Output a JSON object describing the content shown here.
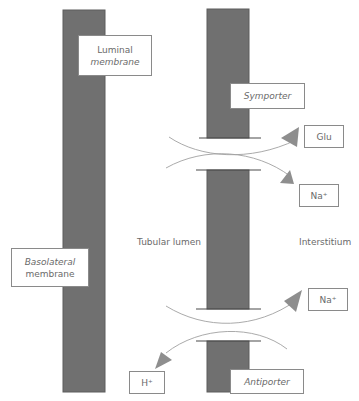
{
  "colors": {
    "membrane": "#6f6f6f",
    "membrane_edge": "#5a5a5a",
    "arrow_line": "#9a9a9a",
    "arrow_head": "#8c8c8c",
    "box_border": "#8a8a8a",
    "text": "#6a6a6a",
    "background": "#ffffff"
  },
  "labels": {
    "luminal_membrane": {
      "line1": "Luminal",
      "line2": "membrane"
    },
    "basolateral_membrane": {
      "line1": "Basolateral",
      "line2": "membrane"
    },
    "symporter": "Symporter",
    "antiporter": "Antiporter",
    "tubular_lumen": "Tubular lumen",
    "interstitium": "Interstitium"
  },
  "symporter_transport": {
    "substrates": [
      {
        "name": "Glu",
        "direction": "to interstitium"
      },
      {
        "name": "Na⁺",
        "direction": "to interstitium"
      }
    ]
  },
  "antiporter_transport": {
    "substrates": [
      {
        "name": "Na⁺",
        "direction": "to interstitium"
      },
      {
        "name": "H⁺",
        "direction": "to tubular lumen"
      }
    ]
  }
}
